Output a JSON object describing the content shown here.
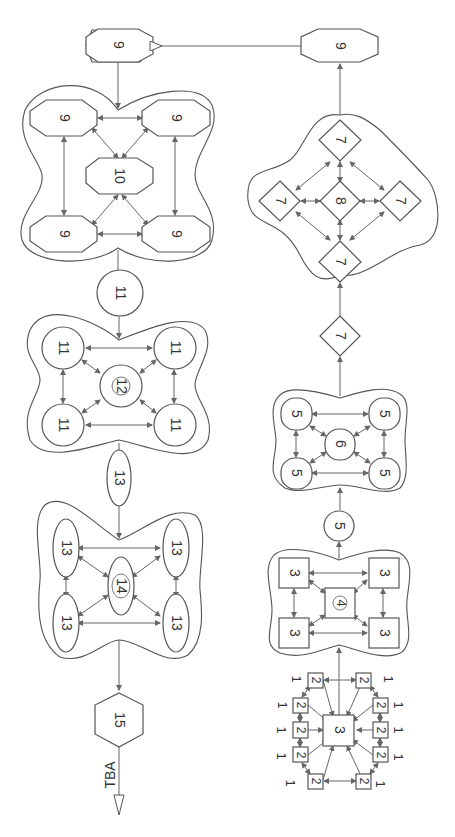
{
  "diagram": {
    "orientation": "rotated 90° clockwise (text reads bottom-to-top)",
    "colors": {
      "stroke": "#555555",
      "background": "#ffffff",
      "text": "#333333"
    },
    "output_label": "TBA",
    "left_column": {
      "top_node": {
        "label": "9",
        "shape": "octagon"
      },
      "cluster_9_10": {
        "outer": [
          "9",
          "9",
          "9",
          "9"
        ],
        "center": "10",
        "shape": "octagon"
      },
      "link_node_11": {
        "label": "11",
        "shape": "circle"
      },
      "cluster_11_12": {
        "outer": [
          "11",
          "11",
          "11",
          "11"
        ],
        "center": "12",
        "shape": "circle"
      },
      "link_node_13": {
        "label": "13",
        "shape": "ellipse"
      },
      "cluster_13_14": {
        "outer": [
          "13",
          "13",
          "13",
          "13"
        ],
        "center": "14",
        "shape": "ellipse"
      },
      "final_node": {
        "label": "15",
        "shape": "hexagon"
      }
    },
    "right_column": {
      "top_node": {
        "label": "9",
        "shape": "octagon"
      },
      "cluster_7_8": {
        "outer": [
          "7",
          "7",
          "7",
          "7"
        ],
        "center": "8",
        "shape": "diamond"
      },
      "link_node_7": {
        "label": "7",
        "shape": "diamond"
      },
      "cluster_5_6": {
        "outer": [
          "5",
          "5",
          "5",
          "5"
        ],
        "center": "6",
        "shape": "rounded-square"
      },
      "link_node_5": {
        "label": "5",
        "shape": "circle"
      },
      "cluster_3_4": {
        "outer": [
          "3",
          "3",
          "3",
          "3"
        ],
        "center": "4",
        "shape": "square"
      },
      "input_cluster": {
        "center": "3",
        "ring": [
          "2",
          "2",
          "2",
          "2",
          "2",
          "2",
          "2",
          "2",
          "2",
          "2"
        ],
        "inputs": [
          "1",
          "1",
          "1",
          "1",
          "1",
          "1",
          "1",
          "1",
          "1",
          "1"
        ]
      }
    }
  }
}
